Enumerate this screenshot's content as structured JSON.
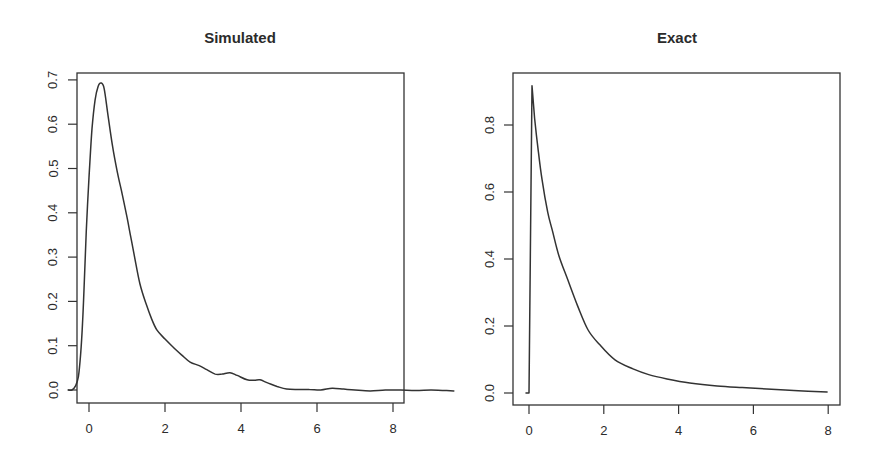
{
  "chart_data": [
    {
      "type": "line",
      "title": "Simulated",
      "xlabel": "",
      "ylabel": "",
      "xlim": [
        -0.5,
        8.3
      ],
      "ylim": [
        -0.03,
        0.72
      ],
      "grid": false,
      "legend": null,
      "x_ticks": [
        0,
        2,
        4,
        6,
        8
      ],
      "x_tick_labels": [
        "0",
        "2",
        "4",
        "6",
        "8"
      ],
      "y_ticks": [
        0.0,
        0.1,
        0.2,
        0.3,
        0.4,
        0.5,
        0.6,
        0.7
      ],
      "y_tick_labels": [
        "0.0",
        "0.1",
        "0.2",
        "0.3",
        "0.4",
        "0.5",
        "0.6",
        "0.7"
      ],
      "clip_curve_to_frame": false,
      "series": [
        {
          "name": "simulated density",
          "x": [
            -0.55,
            -0.45,
            -0.35,
            -0.28,
            -0.22,
            -0.17,
            -0.12,
            -0.07,
            0.0,
            0.08,
            0.16,
            0.24,
            0.32,
            0.4,
            0.5,
            0.62,
            0.75,
            0.88,
            1.0,
            1.1,
            1.2,
            1.34,
            1.5,
            1.65,
            1.79,
            2.0,
            2.21,
            2.45,
            2.66,
            2.9,
            3.1,
            3.32,
            3.5,
            3.71,
            3.9,
            4.16,
            4.35,
            4.5,
            4.7,
            4.95,
            5.2,
            5.5,
            5.8,
            6.1,
            6.4,
            6.7,
            7.0,
            7.4,
            7.8,
            8.2,
            8.6,
            9.0,
            9.3,
            9.6
          ],
          "y": [
            0.0,
            0.0,
            0.01,
            0.03,
            0.08,
            0.15,
            0.25,
            0.36,
            0.48,
            0.59,
            0.655,
            0.685,
            0.693,
            0.68,
            0.62,
            0.55,
            0.49,
            0.44,
            0.39,
            0.345,
            0.3,
            0.24,
            0.195,
            0.16,
            0.135,
            0.115,
            0.097,
            0.078,
            0.063,
            0.055,
            0.046,
            0.036,
            0.036,
            0.039,
            0.033,
            0.023,
            0.022,
            0.023,
            0.016,
            0.008,
            0.002,
            0.001,
            0.001,
            0.0,
            0.004,
            0.002,
            0.0,
            -0.002,
            0.0,
            0.0,
            -0.001,
            0.0,
            -0.001,
            -0.002
          ]
        }
      ],
      "frame_px": {
        "left": 77,
        "top": 73,
        "right": 404,
        "bottom": 403
      },
      "scale_px": {
        "x0": 89,
        "x_per_unit": 38.0,
        "y0": 390,
        "y_per_unit": 443
      }
    },
    {
      "type": "line",
      "title": "Exact",
      "xlabel": "",
      "ylabel": "",
      "xlim": [
        -0.4,
        8.3
      ],
      "ylim": [
        -0.035,
        0.98
      ],
      "grid": false,
      "legend": null,
      "x_ticks": [
        0,
        2,
        4,
        6,
        8
      ],
      "x_tick_labels": [
        "0",
        "2",
        "4",
        "6",
        "8"
      ],
      "y_ticks": [
        0.0,
        0.2,
        0.4,
        0.6,
        0.8
      ],
      "y_tick_labels": [
        "0.0",
        "0.2",
        "0.4",
        "0.6",
        "0.8"
      ],
      "clip_curve_to_frame": false,
      "series": [
        {
          "name": "exact density",
          "x": [
            -0.08,
            -0.02,
            0.0,
            0.08,
            0.15,
            0.25,
            0.35,
            0.5,
            0.62,
            0.8,
            1.04,
            1.3,
            1.58,
            1.9,
            2.3,
            2.78,
            3.2,
            3.69,
            4.3,
            5.03,
            5.7,
            6.36,
            7.2,
            7.97
          ],
          "y": [
            0.0,
            0.0,
            0.0,
            0.917,
            0.82,
            0.72,
            0.636,
            0.54,
            0.487,
            0.41,
            0.337,
            0.26,
            0.188,
            0.143,
            0.099,
            0.072,
            0.055,
            0.042,
            0.03,
            0.021,
            0.016,
            0.012,
            0.007,
            0.003
          ]
        }
      ],
      "frame_px": {
        "left": 513,
        "top": 73,
        "right": 840,
        "bottom": 405
      },
      "scale_px": {
        "x0": 529,
        "x_per_unit": 37.4,
        "y0": 393,
        "y_per_unit": 335
      }
    }
  ]
}
